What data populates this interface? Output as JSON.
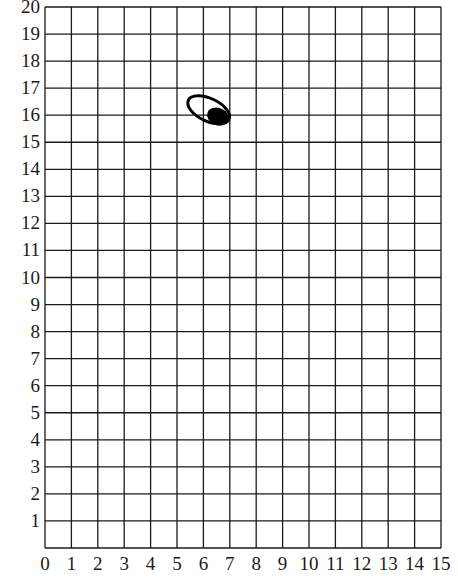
{
  "grid": {
    "x_min": 0,
    "x_max": 15,
    "y_min": 0,
    "y_max": 20,
    "x_tick_labels": [
      "0",
      "1",
      "2",
      "3",
      "4",
      "5",
      "6",
      "7",
      "8",
      "9",
      "10",
      "11",
      "12",
      "13",
      "14",
      "15"
    ],
    "y_tick_labels": [
      "1",
      "2",
      "3",
      "4",
      "5",
      "6",
      "7",
      "8",
      "9",
      "10",
      "11",
      "12",
      "13",
      "14",
      "15",
      "16",
      "17",
      "18",
      "19",
      "20"
    ],
    "line_color": "#1a1a1a",
    "background": "#ffffff"
  },
  "shapes": [
    {
      "type": "ellipse-outline",
      "cx": 6.2,
      "cy": 16.2,
      "rx": 0.85,
      "ry": 0.42,
      "rotation_deg": 25,
      "color": "#000000"
    },
    {
      "type": "ellipse-filled",
      "cx": 6.55,
      "cy": 15.95,
      "rx": 0.42,
      "ry": 0.32,
      "rotation_deg": 20,
      "color": "#000000"
    }
  ],
  "chart_data": {
    "type": "scatter",
    "title": "",
    "xlabel": "",
    "ylabel": "",
    "xlim": [
      0,
      15
    ],
    "ylim": [
      0,
      20
    ],
    "grid": true,
    "x_ticks": [
      0,
      1,
      2,
      3,
      4,
      5,
      6,
      7,
      8,
      9,
      10,
      11,
      12,
      13,
      14,
      15
    ],
    "y_ticks": [
      1,
      2,
      3,
      4,
      5,
      6,
      7,
      8,
      9,
      10,
      11,
      12,
      13,
      14,
      15,
      16,
      17,
      18,
      19,
      20
    ],
    "annotations": [
      {
        "shape": "ellipse outline",
        "center": [
          6.2,
          16.2
        ]
      },
      {
        "shape": "filled ellipse",
        "center": [
          6.55,
          15.95
        ]
      }
    ]
  }
}
